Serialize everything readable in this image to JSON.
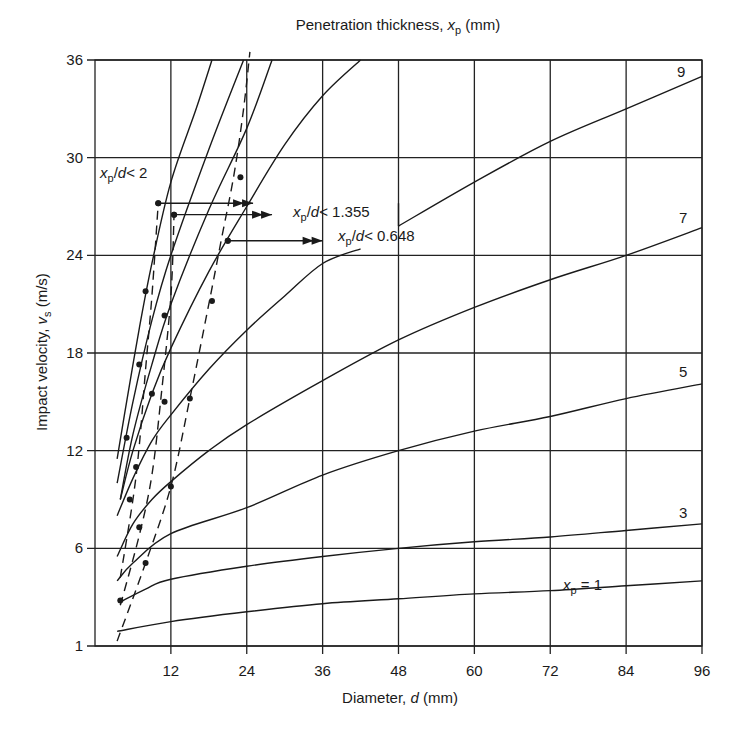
{
  "chart_data": {
    "type": "line",
    "xlabel": "Diameter, d (mm)",
    "ylabel": "Impact velocity, v_s (m/s)",
    "x_ticks": [
      12,
      24,
      36,
      48,
      60,
      72,
      84,
      96
    ],
    "y_ticks": [
      "1",
      "6",
      "12",
      "18",
      "24",
      "30",
      "36"
    ],
    "xlim": [
      0,
      96
    ],
    "ylim": [
      0,
      36
    ],
    "grid": true,
    "series": [
      {
        "name": "x_p = 1",
        "label": "x_p = 1",
        "style": "solid",
        "points": [
          [
            3.5,
            0.9
          ],
          [
            12,
            1.5
          ],
          [
            24,
            2.1
          ],
          [
            36,
            2.6
          ],
          [
            48,
            2.9
          ],
          [
            60,
            3.2
          ],
          [
            72,
            3.4
          ],
          [
            84,
            3.7
          ],
          [
            96,
            4.0
          ]
        ]
      },
      {
        "name": "x_p = 3",
        "label": "3",
        "style": "solid",
        "points": [
          [
            4,
            2.7
          ],
          [
            8,
            3.5
          ],
          [
            12,
            4.1
          ],
          [
            24,
            4.9
          ],
          [
            36,
            5.5
          ],
          [
            48,
            6.0
          ],
          [
            60,
            6.4
          ],
          [
            72,
            6.7
          ],
          [
            84,
            7.1
          ],
          [
            96,
            7.5
          ]
        ]
      },
      {
        "name": "x_p = 5",
        "label": "5",
        "style": "solid",
        "points": [
          [
            3.5,
            4.0
          ],
          [
            6,
            5.1
          ],
          [
            12,
            6.9
          ],
          [
            24,
            8.5
          ],
          [
            36,
            10.5
          ],
          [
            48,
            12.0
          ],
          [
            60,
            13.2
          ],
          [
            72,
            14.1
          ],
          [
            84,
            15.2
          ],
          [
            96,
            16.1
          ]
        ]
      },
      {
        "name": "x_p = 7 (lower)",
        "label": "",
        "style": "solid",
        "points": [
          [
            3.5,
            5.5
          ],
          [
            6,
            7.5
          ],
          [
            9,
            9.0
          ],
          [
            12,
            10.1
          ],
          [
            18,
            12.0
          ],
          [
            24,
            13.6
          ],
          [
            36,
            16.3
          ],
          [
            48,
            18.8
          ],
          [
            60,
            20.8
          ],
          [
            72,
            22.5
          ],
          [
            84,
            24.0
          ],
          [
            96,
            25.7
          ]
        ]
      },
      {
        "name": "x_p = 7",
        "label": "7",
        "style": "solid",
        "points": [
          [
            3.5,
            8.0
          ],
          [
            6,
            10.3
          ],
          [
            9,
            12.6
          ],
          [
            12,
            14.2
          ],
          [
            18,
            17.0
          ],
          [
            24,
            19.4
          ],
          [
            30,
            21.5
          ],
          [
            36,
            23.5
          ],
          [
            42,
            24.4
          ]
        ]
      },
      {
        "name": "x_p = 9",
        "label": "9",
        "style": "solid",
        "points": [
          [
            48,
            25.8
          ],
          [
            60,
            28.5
          ],
          [
            72,
            31.0
          ],
          [
            84,
            33.0
          ],
          [
            96,
            35.0
          ]
        ]
      },
      {
        "name": "curve-a",
        "label": "",
        "style": "solid",
        "points": [
          [
            4,
            9.0
          ],
          [
            6,
            12.0
          ],
          [
            9,
            15.5
          ],
          [
            12,
            18.3
          ],
          [
            18,
            23.0
          ],
          [
            24,
            27.0
          ],
          [
            30,
            30.8
          ],
          [
            36,
            33.8
          ],
          [
            42,
            36.0
          ]
        ]
      },
      {
        "name": "curve-b",
        "label": "",
        "style": "solid",
        "points": [
          [
            4,
            9.0
          ],
          [
            6,
            13.0
          ],
          [
            9,
            17.3
          ],
          [
            12,
            21.0
          ],
          [
            18,
            26.8
          ],
          [
            24,
            31.8
          ],
          [
            28,
            36.0
          ]
        ]
      },
      {
        "name": "curve-c",
        "label": "",
        "style": "solid",
        "points": [
          [
            3.5,
            10.0
          ],
          [
            6,
            15.0
          ],
          [
            9,
            20.0
          ],
          [
            12,
            24.0
          ],
          [
            18,
            30.5
          ],
          [
            23.5,
            36.0
          ]
        ]
      },
      {
        "name": "curve-d",
        "label": "",
        "style": "solid",
        "points": [
          [
            3.5,
            11.5
          ],
          [
            5,
            15.0
          ],
          [
            7,
            19.5
          ],
          [
            9,
            23.5
          ],
          [
            12,
            28.5
          ],
          [
            16,
            33.0
          ],
          [
            18.5,
            36.0
          ]
        ]
      }
    ],
    "limit_lines": [
      {
        "name": "x_p/d < 2",
        "style": "dashed",
        "points": [
          [
            4,
            4.2
          ],
          [
            6,
            9.0
          ],
          [
            7,
            12.3
          ],
          [
            8,
            17.0
          ],
          [
            9,
            21.5
          ],
          [
            10,
            27.2
          ]
        ]
      },
      {
        "name": "x_p/d < 1.355",
        "style": "dashed",
        "points": [
          [
            4,
            2.5
          ],
          [
            7,
            6.8
          ],
          [
            9,
            10.5
          ],
          [
            10.5,
            15.5
          ],
          [
            12,
            21.5
          ],
          [
            12.5,
            26.5
          ]
        ]
      },
      {
        "name": "x_p/d < 0.648",
        "style": "dashed",
        "points": [
          [
            3.5,
            0.3
          ],
          [
            8,
            5.1
          ],
          [
            12,
            9.8
          ],
          [
            15,
            15.2
          ],
          [
            18,
            21.0
          ],
          [
            20,
            25.0
          ],
          [
            22,
            29.0
          ],
          [
            23.5,
            33.0
          ],
          [
            24.5,
            36.5
          ]
        ]
      }
    ],
    "markers": [
      [
        4,
        2.8
      ],
      [
        8,
        5.1
      ],
      [
        12,
        9.8
      ],
      [
        15,
        15.2
      ],
      [
        21,
        24.9
      ],
      [
        5.5,
        9.0
      ],
      [
        9,
        15.5
      ],
      [
        11,
        20.3
      ],
      [
        12.5,
        26.5
      ],
      [
        5,
        12.8
      ],
      [
        7,
        17.3
      ],
      [
        8,
        21.8
      ],
      [
        10,
        27.2
      ],
      [
        23,
        28.8
      ],
      [
        18.5,
        21.2
      ],
      [
        11,
        15.0
      ],
      [
        6.5,
        11.0
      ],
      [
        7,
        7.3
      ]
    ],
    "annotations": [
      {
        "text": "x_p/d < 2",
        "arrow_from": [
          10,
          27.2
        ],
        "arrow_to": [
          25,
          27.2
        ]
      },
      {
        "text": "x_p/d < 1.355",
        "arrow_from": [
          12.5,
          26.5
        ],
        "arrow_to": [
          28,
          26.5
        ]
      },
      {
        "text": "x_p/d < 0.648",
        "arrow_from": [
          21,
          24.9
        ],
        "arrow_to": [
          36,
          24.9
        ]
      }
    ]
  },
  "labels": {
    "title_main": "Penetration thickness, ",
    "title_var": "x",
    "title_sub": "p",
    "title_unit": " (mm)",
    "xlabel_main": "Diameter, ",
    "xlabel_var": "d",
    "xlabel_unit": " (mm)",
    "ylabel_main": "Impact velocity, ",
    "ylabel_var": "v",
    "ylabel_sub": "s",
    "ylabel_unit": " (m/s)",
    "curve_9": "9",
    "curve_7": "7",
    "curve_5": "5",
    "curve_3": "3",
    "curve_1_var": "x",
    "curve_1_sub": "p",
    "curve_1_eq": " = 1",
    "ratio_2": "< 2",
    "ratio_1355": "< 1.355",
    "ratio_0648": "< 0.648",
    "ratio_prefix_var": "x",
    "ratio_prefix_sub": "p",
    "ratio_prefix_slash": "/",
    "ratio_prefix_d": "d"
  }
}
